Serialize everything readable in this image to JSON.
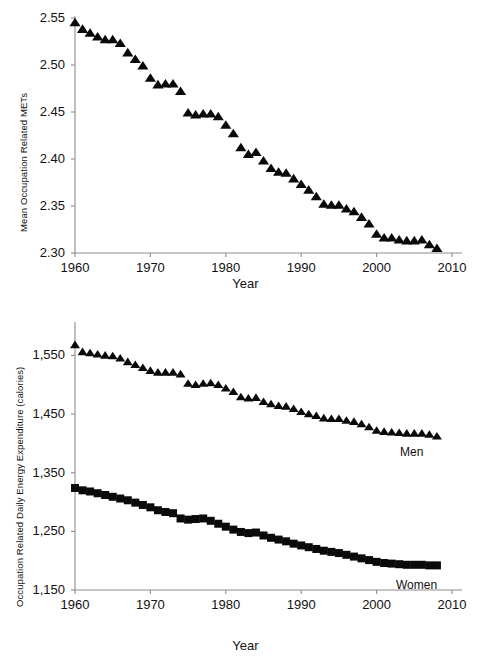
{
  "figure": {
    "background": "#ffffff",
    "marker_color": "#0a0a0a",
    "axis_color": "#8c8c8c"
  },
  "chart_data": [
    {
      "type": "scatter",
      "panel": "top",
      "title": "",
      "xlabel": "Year",
      "ylabel": "Mean Occupation Related METs",
      "xlim": [
        1960,
        2010
      ],
      "ylim": [
        2.3,
        2.55
      ],
      "xticks": [
        1960,
        1970,
        1980,
        1990,
        2000,
        2010
      ],
      "xticklabels": [
        "1960",
        "1970",
        "1980",
        "1990",
        "2000",
        "2010"
      ],
      "yticks": [
        2.3,
        2.35,
        2.4,
        2.45,
        2.5,
        2.55
      ],
      "yticklabels": [
        "2.30",
        "2.35",
        "2.40",
        "2.45",
        "2.50",
        "2.55"
      ],
      "grid": false,
      "legend": "none",
      "marker": "triangle",
      "series": [
        {
          "name": "Mean Occupation Related METs",
          "x": [
            1960,
            1961,
            1962,
            1963,
            1964,
            1965,
            1966,
            1967,
            1968,
            1969,
            1970,
            1971,
            1972,
            1973,
            1974,
            1975,
            1976,
            1977,
            1978,
            1979,
            1980,
            1981,
            1982,
            1983,
            1984,
            1985,
            1986,
            1987,
            1988,
            1989,
            1990,
            1991,
            1992,
            1993,
            1994,
            1995,
            1996,
            1997,
            1998,
            1999,
            2000,
            2001,
            2002,
            2003,
            2004,
            2005,
            2006,
            2007,
            2008
          ],
          "values": [
            2.545,
            2.538,
            2.534,
            2.53,
            2.527,
            2.527,
            2.523,
            2.513,
            2.506,
            2.499,
            2.486,
            2.479,
            2.48,
            2.48,
            2.472,
            2.449,
            2.447,
            2.448,
            2.448,
            2.445,
            2.436,
            2.427,
            2.412,
            2.405,
            2.407,
            2.398,
            2.39,
            2.386,
            2.385,
            2.379,
            2.373,
            2.367,
            2.36,
            2.352,
            2.351,
            2.351,
            2.347,
            2.344,
            2.338,
            2.331,
            2.32,
            2.316,
            2.316,
            2.314,
            2.313,
            2.313,
            2.314,
            2.309,
            2.305
          ]
        }
      ]
    },
    {
      "type": "scatter",
      "panel": "bottom",
      "title": "",
      "xlabel": "Year",
      "ylabel": "Occupation Related Daily Energy Expenditure (calories)",
      "xlim": [
        1960,
        2010
      ],
      "ylim": [
        1150,
        1590
      ],
      "xticks": [
        1960,
        1970,
        1980,
        1990,
        2000,
        2010
      ],
      "xticklabels": [
        "1960",
        "1970",
        "1980",
        "1990",
        "2000",
        "2010"
      ],
      "yticks": [
        1150,
        1250,
        1350,
        1450,
        1550
      ],
      "yticklabels": [
        "1,150",
        "1,250",
        "1,350",
        "1,450",
        "1,550"
      ],
      "grid": false,
      "legend": "inline-annotations",
      "series": [
        {
          "name": "Men",
          "marker": "triangle",
          "label": "Men",
          "x": [
            1960,
            1961,
            1962,
            1963,
            1964,
            1965,
            1966,
            1967,
            1968,
            1969,
            1970,
            1971,
            1972,
            1973,
            1974,
            1975,
            1976,
            1977,
            1978,
            1979,
            1980,
            1981,
            1982,
            1983,
            1984,
            1985,
            1986,
            1987,
            1988,
            1989,
            1990,
            1991,
            1992,
            1993,
            1994,
            1995,
            1996,
            1997,
            1998,
            1999,
            2000,
            2001,
            2002,
            2003,
            2004,
            2005,
            2006,
            2007,
            2008
          ],
          "values": [
            1568,
            1556,
            1554,
            1552,
            1550,
            1549,
            1545,
            1539,
            1534,
            1529,
            1524,
            1521,
            1521,
            1521,
            1518,
            1502,
            1500,
            1502,
            1503,
            1500,
            1494,
            1488,
            1479,
            1477,
            1478,
            1471,
            1467,
            1464,
            1463,
            1459,
            1454,
            1450,
            1447,
            1443,
            1442,
            1442,
            1439,
            1437,
            1433,
            1428,
            1422,
            1420,
            1419,
            1418,
            1417,
            1417,
            1417,
            1415,
            1412
          ]
        },
        {
          "name": "Women",
          "marker": "square",
          "label": "Women",
          "x": [
            1960,
            1961,
            1962,
            1963,
            1964,
            1965,
            1966,
            1967,
            1968,
            1969,
            1970,
            1971,
            1972,
            1973,
            1974,
            1975,
            1976,
            1977,
            1978,
            1979,
            1980,
            1981,
            1982,
            1983,
            1984,
            1985,
            1986,
            1987,
            1988,
            1989,
            1990,
            1991,
            1992,
            1993,
            1994,
            1995,
            1996,
            1997,
            1998,
            1999,
            2000,
            2001,
            2002,
            2003,
            2004,
            2005,
            2006,
            2007,
            2008
          ],
          "values": [
            1324,
            1320,
            1318,
            1315,
            1312,
            1309,
            1306,
            1303,
            1299,
            1295,
            1291,
            1286,
            1283,
            1281,
            1272,
            1270,
            1271,
            1272,
            1268,
            1263,
            1258,
            1253,
            1249,
            1247,
            1248,
            1243,
            1239,
            1236,
            1233,
            1229,
            1226,
            1223,
            1220,
            1217,
            1215,
            1213,
            1210,
            1207,
            1204,
            1201,
            1198,
            1196,
            1195,
            1194,
            1193,
            1193,
            1193,
            1192,
            1192
          ]
        }
      ]
    }
  ]
}
